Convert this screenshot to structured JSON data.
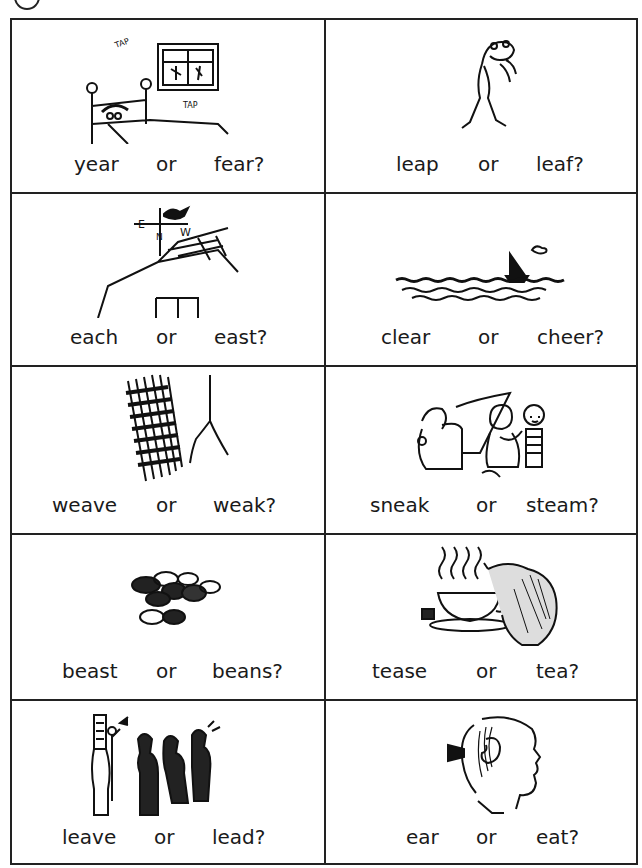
{
  "worksheet": {
    "cards": [
      {
        "icon": "bed-window-tap-icon",
        "word1": "year",
        "or": "or",
        "word2": "fear?",
        "sound_text": [
          "TAP",
          "TAP"
        ]
      },
      {
        "icon": "frog-leaping-icon",
        "word1": "leap",
        "or": "or",
        "word2": "leaf?"
      },
      {
        "icon": "weathervane-roof-icon",
        "word1": "each",
        "or": "or",
        "word2": "east?",
        "vane_letters": [
          "E",
          "N",
          "W"
        ]
      },
      {
        "icon": "sea-sailboat-icon",
        "word1": "clear",
        "or": "or",
        "word2": "cheer?"
      },
      {
        "icon": "basket-weave-icon",
        "word1": "weave",
        "or": "or",
        "word2": "weak?"
      },
      {
        "icon": "children-sneaking-icon",
        "word1": "sneak",
        "or": "or",
        "word2": "steam?"
      },
      {
        "icon": "beans-icon",
        "word1": "beast",
        "or": "or",
        "word2": "beans?"
      },
      {
        "icon": "teacup-teapot-icon",
        "word1": "tease",
        "or": "or",
        "word2": "tea?"
      },
      {
        "icon": "marching-band-icon",
        "word1": "leave",
        "or": "or",
        "word2": "lead?"
      },
      {
        "icon": "ear-profile-icon",
        "word1": "ear",
        "or": "or",
        "word2": "eat?"
      }
    ]
  }
}
